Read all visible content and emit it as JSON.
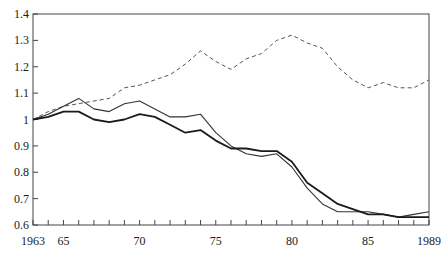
{
  "chart_data": {
    "type": "line",
    "title": "",
    "xlabel": "",
    "ylabel": "",
    "xlim": [
      1963,
      1989
    ],
    "ylim": [
      0.6,
      1.4
    ],
    "grid": false,
    "legend": null,
    "x_tick_labels": [
      {
        "year": 1963,
        "label": "1963"
      },
      {
        "year": 1965,
        "label": "65"
      },
      {
        "year": 1970,
        "label": "70"
      },
      {
        "year": 1975,
        "label": "75"
      },
      {
        "year": 1980,
        "label": "80"
      },
      {
        "year": 1985,
        "label": "85"
      },
      {
        "year": 1989,
        "label": "1989"
      }
    ],
    "y_tick_labels": [
      {
        "value": 0.6,
        "label": "0.6"
      },
      {
        "value": 0.7,
        "label": "0.7"
      },
      {
        "value": 0.8,
        "label": "0.8"
      },
      {
        "value": 0.9,
        "label": "0.9"
      },
      {
        "value": 1.0,
        "label": "1"
      },
      {
        "value": 1.1,
        "label": "1.1"
      },
      {
        "value": 1.2,
        "label": "1.2"
      },
      {
        "value": 1.3,
        "label": "1.3"
      },
      {
        "value": 1.4,
        "label": "1.4"
      }
    ],
    "x": [
      1963,
      1964,
      1965,
      1966,
      1967,
      1968,
      1969,
      1970,
      1971,
      1972,
      1973,
      1974,
      1975,
      1976,
      1977,
      1978,
      1979,
      1980,
      1981,
      1982,
      1983,
      1984,
      1985,
      1986,
      1987,
      1988,
      1989
    ],
    "series": [
      {
        "name": "dashed series",
        "style": "dashed",
        "color": "#555555",
        "width": 1,
        "values": [
          1.0,
          1.03,
          1.05,
          1.06,
          1.07,
          1.08,
          1.12,
          1.13,
          1.15,
          1.17,
          1.21,
          1.26,
          1.22,
          1.19,
          1.23,
          1.25,
          1.3,
          1.32,
          1.29,
          1.27,
          1.2,
          1.15,
          1.12,
          1.14,
          1.12,
          1.12,
          1.15
        ]
      },
      {
        "name": "thin solid series",
        "style": "solid",
        "color": "#333333",
        "width": 1.1,
        "values": [
          1.0,
          1.02,
          1.05,
          1.08,
          1.04,
          1.03,
          1.06,
          1.07,
          1.04,
          1.01,
          1.01,
          1.02,
          0.95,
          0.9,
          0.87,
          0.86,
          0.87,
          0.82,
          0.74,
          0.68,
          0.65,
          0.65,
          0.65,
          0.64,
          0.63,
          0.64,
          0.65
        ]
      },
      {
        "name": "thick solid series",
        "style": "solid",
        "color": "#1a1a1a",
        "width": 1.8,
        "values": [
          1.0,
          1.01,
          1.03,
          1.03,
          1.0,
          0.99,
          1.0,
          1.02,
          1.01,
          0.98,
          0.95,
          0.96,
          0.92,
          0.89,
          0.89,
          0.88,
          0.88,
          0.84,
          0.76,
          0.72,
          0.68,
          0.66,
          0.64,
          0.64,
          0.63,
          0.63,
          0.63
        ]
      }
    ]
  },
  "plot_area": {
    "left": 33,
    "right": 429,
    "top": 14,
    "bottom": 225
  },
  "colors": {
    "axis": "#444444",
    "background": "#ffffff"
  }
}
